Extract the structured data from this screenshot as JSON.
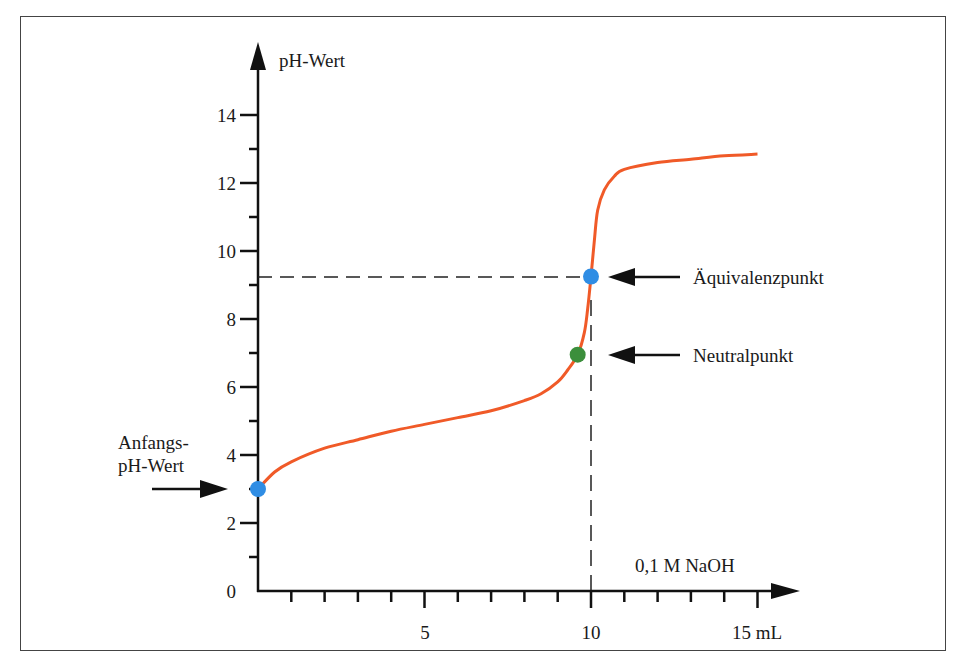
{
  "chart_data": {
    "type": "line",
    "title": "",
    "xlabel": "0,1 M NaOH",
    "x_unit_label": "15 mL",
    "ylabel": "pH-Wert",
    "xlim": [
      0,
      15
    ],
    "ylim": [
      0,
      14
    ],
    "x_ticks": [
      0,
      1,
      2,
      3,
      4,
      5,
      6,
      7,
      8,
      9,
      10,
      11,
      12,
      13,
      14,
      15
    ],
    "x_tick_labels": [
      {
        "value": 5,
        "label": "5"
      },
      {
        "value": 10,
        "label": "10"
      },
      {
        "value": 15,
        "label": "15 mL"
      }
    ],
    "y_ticks": [
      0,
      1,
      2,
      3,
      4,
      5,
      6,
      7,
      8,
      9,
      10,
      11,
      12,
      13,
      14
    ],
    "y_tick_labels": [
      {
        "value": 0,
        "label": "0"
      },
      {
        "value": 2,
        "label": "2"
      },
      {
        "value": 4,
        "label": "4"
      },
      {
        "value": 6,
        "label": "6"
      },
      {
        "value": 8,
        "label": "8"
      },
      {
        "value": 10,
        "label": "10"
      },
      {
        "value": 12,
        "label": "12"
      },
      {
        "value": 14,
        "label": "14"
      }
    ],
    "grid": false,
    "series": [
      {
        "name": "Titrationskurve",
        "color": "#f05a28",
        "x": [
          0,
          0.5,
          1,
          2,
          3,
          4,
          5,
          6,
          7,
          8,
          8.5,
          9,
          9.3,
          9.6,
          9.8,
          9.9,
          10,
          10.1,
          10.2,
          10.4,
          10.7,
          11,
          12,
          13,
          14,
          15
        ],
        "y": [
          3.0,
          3.5,
          3.8,
          4.2,
          4.45,
          4.7,
          4.9,
          5.1,
          5.3,
          5.6,
          5.8,
          6.15,
          6.5,
          6.95,
          7.6,
          8.3,
          9.25,
          10.3,
          11.2,
          11.8,
          12.2,
          12.4,
          12.6,
          12.7,
          12.8,
          12.85
        ]
      }
    ],
    "points": [
      {
        "name": "Anfangs-pH-Wert",
        "x": 0,
        "y": 3.0,
        "color": "#2f8de4"
      },
      {
        "name": "Neutralpunkt",
        "x": 9.6,
        "y": 6.95,
        "color": "#3c8f3c"
      },
      {
        "name": "Äquivalenzpunkt",
        "x": 10,
        "y": 9.25,
        "color": "#2f8de4"
      }
    ],
    "reference_lines": [
      {
        "type": "horizontal",
        "y": 9.25,
        "x_from": 0,
        "x_to": 10,
        "style": "dashed"
      },
      {
        "type": "vertical",
        "x": 10,
        "y_from": 0,
        "y_to": 9.25,
        "style": "dashed"
      }
    ],
    "annotations": [
      {
        "text": "Äquivalenzpunkt",
        "arrow_to": "Äquivalenzpunkt"
      },
      {
        "text": "Neutralpunkt",
        "arrow_to": "Neutralpunkt"
      },
      {
        "text": "Anfangs-",
        "text2": "pH-Wert",
        "arrow_to": "Anfangs-pH-Wert"
      }
    ]
  },
  "labels": {
    "y_axis": "pH-Wert",
    "x_axis": "0,1 M NaOH",
    "y_ticks": [
      "0",
      "2",
      "4",
      "6",
      "8",
      "10",
      "12",
      "14"
    ],
    "x_tick_5": "5",
    "x_tick_10": "10",
    "x_tick_15": "15 mL",
    "aequivalenz": "Äquivalenzpunkt",
    "neutral": "Neutralpunkt",
    "anfang_line1": "Anfangs-",
    "anfang_line2": "pH-Wert"
  },
  "colors": {
    "curve": "#f05a28",
    "blue_point": "#2f8de4",
    "green_point": "#3c8f3c",
    "axis": "#111111"
  }
}
